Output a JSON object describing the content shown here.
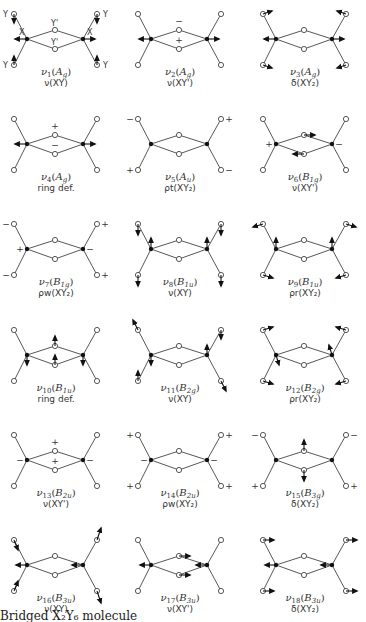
{
  "figure": {
    "caption": "Bridged X₂Y₆ molecule",
    "atom_labels": {
      "Y": "Y",
      "X": "X",
      "Yp": "Y'"
    },
    "colors": {
      "ink": "#111111",
      "bond": "#444444",
      "background": "#ffffff"
    },
    "layout": {
      "col_x": [
        0,
        124,
        249
      ],
      "row_y": [
        0,
        105,
        210,
        316,
        421,
        526
      ]
    },
    "modes": [
      {
        "id": 1,
        "name": "ν1",
        "sub": "1",
        "sym": "A",
        "symsub": "g",
        "desc": "ν(XY)",
        "arrows": {
          "XL": [
            -12,
            0
          ],
          "XR": [
            12,
            0
          ],
          "YTL": [
            0,
            9
          ],
          "YBL": [
            0,
            -9
          ],
          "YTR": [
            0,
            9
          ],
          "YBR": [
            0,
            -9
          ]
        },
        "signs": [],
        "show_atom_labels": true
      },
      {
        "id": 2,
        "name": "ν2",
        "sub": "2",
        "sym": "A",
        "symsub": "g",
        "desc": "ν(XY')",
        "arrows": {
          "XL": [
            -12,
            0
          ],
          "XR": [
            12,
            0
          ]
        },
        "signs": [
          {
            "at": "YpT",
            "dx": 0,
            "dy": -6,
            "t": "−"
          },
          {
            "at": "YpB",
            "dx": 0,
            "dy": -6,
            "t": "+"
          }
        ]
      },
      {
        "id": 3,
        "name": "ν3",
        "sub": "3",
        "sym": "A",
        "symsub": "g",
        "desc": "δ(XY₂)",
        "arrows": {
          "XL": [
            -12,
            0
          ],
          "XR": [
            12,
            0
          ],
          "YTL": [
            9,
            -3
          ],
          "YBL": [
            9,
            3
          ],
          "YTR": [
            -9,
            -3
          ],
          "YBR": [
            -9,
            3
          ]
        },
        "signs": []
      },
      {
        "id": 4,
        "name": "ν4",
        "sub": "4",
        "sym": "A",
        "symsub": "g",
        "desc": "ring def.",
        "arrows": {
          "XL": [
            -12,
            0
          ],
          "XR": [
            12,
            0
          ]
        },
        "signs": [
          {
            "at": "YpT",
            "dx": 0,
            "dy": -6,
            "t": "+"
          },
          {
            "at": "YpB",
            "dx": 0,
            "dy": -6,
            "t": "−"
          }
        ]
      },
      {
        "id": 5,
        "name": "ν5",
        "sub": "5",
        "sym": "A",
        "symsub": "u",
        "desc": "ρt(XY₂)",
        "arrows": {},
        "signs": [
          {
            "at": "YTL",
            "dx": -8,
            "dy": 3,
            "t": "−"
          },
          {
            "at": "YBL",
            "dx": -8,
            "dy": 3,
            "t": "+"
          },
          {
            "at": "YTR",
            "dx": 8,
            "dy": 3,
            "t": "+"
          },
          {
            "at": "YBR",
            "dx": 8,
            "dy": 3,
            "t": "−"
          }
        ]
      },
      {
        "id": 6,
        "name": "ν6",
        "sub": "6",
        "sym": "B",
        "symsub": "1g",
        "desc": "ν(XY')",
        "arrows": {
          "YpT": [
            11,
            0
          ],
          "YpB": [
            -11,
            0
          ]
        },
        "signs": [
          {
            "at": "XL",
            "dx": -7,
            "dy": 3,
            "t": "+"
          },
          {
            "at": "XR",
            "dx": 7,
            "dy": 3,
            "t": "−"
          }
        ]
      },
      {
        "id": 7,
        "name": "ν7",
        "sub": "7",
        "sym": "B",
        "symsub": "1g",
        "desc": "ρw(XY₂)",
        "arrows": {},
        "signs": [
          {
            "at": "YTL",
            "dx": -8,
            "dy": 3,
            "t": "−"
          },
          {
            "at": "YBL",
            "dx": -8,
            "dy": 3,
            "t": "−"
          },
          {
            "at": "YTR",
            "dx": 8,
            "dy": 3,
            "t": "+"
          },
          {
            "at": "YBR",
            "dx": 8,
            "dy": 3,
            "t": "+"
          },
          {
            "at": "XL",
            "dx": -7,
            "dy": 3,
            "t": "+"
          },
          {
            "at": "XR",
            "dx": 7,
            "dy": 3,
            "t": "−"
          }
        ]
      },
      {
        "id": 8,
        "name": "ν8",
        "sub": "8",
        "sym": "B",
        "symsub": "1u",
        "desc": "ν(XY)",
        "arrows": {
          "XL": [
            0,
            -11
          ],
          "XR": [
            0,
            -11
          ],
          "YTL": [
            0,
            11
          ],
          "YBL": [
            0,
            11
          ],
          "YTR": [
            0,
            11
          ],
          "YBR": [
            0,
            11
          ]
        },
        "signs": []
      },
      {
        "id": 9,
        "name": "ν9",
        "sub": "9",
        "sym": "B",
        "symsub": "1u",
        "desc": "ρr(XY₂)",
        "arrows": {
          "XL": [
            0,
            -11
          ],
          "XR": [
            0,
            -11
          ],
          "YTL": [
            -10,
            3
          ],
          "YBL": [
            10,
            3
          ],
          "YTR": [
            10,
            3
          ],
          "YBR": [
            -10,
            3
          ]
        },
        "signs": []
      },
      {
        "id": 10,
        "name": "ν10",
        "sub": "10",
        "sym": "B",
        "symsub": "1u",
        "desc": "ring def.",
        "arrows": {
          "YpT": [
            0,
            -10
          ],
          "YpB": [
            0,
            -10
          ],
          "XL": [
            0,
            10
          ],
          "XR": [
            0,
            10
          ]
        },
        "signs": []
      },
      {
        "id": 11,
        "name": "ν11",
        "sub": "11",
        "sym": "B",
        "symsub": "2g",
        "desc": "ν(XY)",
        "arrows": {
          "YTL": [
            -5,
            -10
          ],
          "XL": [
            0,
            10
          ],
          "YBL": [
            0,
            -10
          ],
          "XR": [
            0,
            -10
          ],
          "YTR": [
            0,
            9
          ],
          "YBR": [
            5,
            10
          ]
        },
        "signs": []
      },
      {
        "id": 12,
        "name": "ν12",
        "sub": "12",
        "sym": "B",
        "symsub": "2g",
        "desc": "ρr(XY₂)",
        "arrows": {
          "YTL": [
            10,
            -3
          ],
          "YBL": [
            10,
            3
          ],
          "YTR": [
            -10,
            -3
          ],
          "YBR": [
            -10,
            3
          ],
          "XL": [
            3,
            10
          ],
          "XR": [
            -3,
            -10
          ]
        },
        "signs": []
      },
      {
        "id": 13,
        "name": "ν13",
        "sub": "13",
        "sym": "B",
        "symsub": "2u",
        "desc": "ν(XY')",
        "arrows": {},
        "signs": [
          {
            "at": "YpT",
            "dx": 0,
            "dy": -6,
            "t": "+"
          },
          {
            "at": "YpB",
            "dx": 0,
            "dy": -6,
            "t": "+"
          },
          {
            "at": "XL",
            "dx": -7,
            "dy": 3,
            "t": "−"
          },
          {
            "at": "XR",
            "dx": 7,
            "dy": 3,
            "t": "−"
          }
        ]
      },
      {
        "id": 14,
        "name": "ν14",
        "sub": "14",
        "sym": "B",
        "symsub": "2u",
        "desc": "ρw(XY₂)",
        "arrows": {},
        "signs": [
          {
            "at": "YTL",
            "dx": -8,
            "dy": 3,
            "t": "+"
          },
          {
            "at": "YBL",
            "dx": -8,
            "dy": 3,
            "t": "+"
          },
          {
            "at": "YTR",
            "dx": 8,
            "dy": 3,
            "t": "+"
          },
          {
            "at": "YBR",
            "dx": 8,
            "dy": 3,
            "t": "+"
          },
          {
            "at": "XL",
            "dx": -7,
            "dy": 3,
            "t": "−"
          },
          {
            "at": "XR",
            "dx": 7,
            "dy": 3,
            "t": "−"
          }
        ]
      },
      {
        "id": 15,
        "name": "ν15",
        "sub": "15",
        "sym": "B",
        "symsub": "3g",
        "desc": "δ(XY₂)",
        "arrows": {
          "YpT": [
            0,
            -11
          ],
          "YpB": [
            0,
            11
          ]
        },
        "signs": [
          {
            "at": "YTL",
            "dx": -8,
            "dy": 3,
            "t": "−"
          },
          {
            "at": "YBL",
            "dx": -8,
            "dy": 3,
            "t": "+"
          },
          {
            "at": "YTR",
            "dx": 8,
            "dy": 3,
            "t": "−"
          },
          {
            "at": "YBR",
            "dx": 8,
            "dy": 3,
            "t": "+"
          }
        ]
      },
      {
        "id": 16,
        "name": "ν16",
        "sub": "16",
        "sym": "B",
        "symsub": "3u",
        "desc": "ν(XY)",
        "arrows": {
          "XL": [
            -11,
            0
          ],
          "XR": [
            -11,
            0
          ],
          "YTL": [
            4,
            10
          ],
          "YBL": [
            4,
            -10
          ],
          "YTR": [
            4,
            -12
          ],
          "YBR": [
            4,
            12
          ]
        },
        "signs": []
      },
      {
        "id": 17,
        "name": "ν17",
        "sub": "17",
        "sym": "B",
        "symsub": "3u",
        "desc": "ν(XY')",
        "arrows": {
          "XL": [
            -11,
            0
          ],
          "XR": [
            -11,
            0
          ],
          "YpT": [
            11,
            0
          ],
          "YpB": [
            11,
            0
          ]
        },
        "signs": []
      },
      {
        "id": 18,
        "name": "ν18",
        "sub": "18",
        "sym": "B",
        "symsub": "3u",
        "desc": "δ(XY₂)",
        "arrows": {
          "XL": [
            -11,
            0
          ],
          "XR": [
            -11,
            0
          ],
          "YTL": [
            11,
            0
          ],
          "YBL": [
            11,
            0
          ],
          "YTR": [
            11,
            0
          ],
          "YBR": [
            11,
            0
          ]
        },
        "signs": []
      }
    ]
  }
}
